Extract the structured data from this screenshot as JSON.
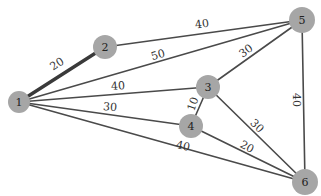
{
  "graph": {
    "node_color": "#a6a6a6",
    "edge_color": "#4a4a4a",
    "nodes": [
      {
        "id": "1",
        "label": "1",
        "x": 19,
        "y": 102,
        "r": 11
      },
      {
        "id": "2",
        "label": "2",
        "x": 105,
        "y": 47,
        "r": 12
      },
      {
        "id": "3",
        "label": "3",
        "x": 208,
        "y": 87,
        "r": 12
      },
      {
        "id": "4",
        "label": "4",
        "x": 191,
        "y": 126,
        "r": 12
      },
      {
        "id": "5",
        "label": "5",
        "x": 302,
        "y": 20,
        "r": 13
      },
      {
        "id": "6",
        "label": "6",
        "x": 305,
        "y": 182,
        "r": 13
      }
    ],
    "edges": [
      {
        "from": "1",
        "to": "2",
        "weight": "20",
        "thick": true,
        "lx": 57,
        "ly": 64,
        "rot": -33
      },
      {
        "from": "2",
        "to": "5",
        "weight": "40",
        "thick": false,
        "lx": 202,
        "ly": 24,
        "rot": -8
      },
      {
        "from": "1",
        "to": "5",
        "weight": "50",
        "thick": false,
        "lx": 158,
        "ly": 55,
        "rot": -16
      },
      {
        "from": "1",
        "to": "3",
        "weight": "40",
        "thick": false,
        "lx": 118,
        "ly": 86,
        "rot": -4
      },
      {
        "from": "1",
        "to": "4",
        "weight": "30",
        "thick": false,
        "lx": 110,
        "ly": 107,
        "rot": 5
      },
      {
        "from": "1",
        "to": "6",
        "weight": "40",
        "thick": false,
        "lx": 183,
        "ly": 146,
        "rot": 12
      },
      {
        "from": "3",
        "to": "5",
        "weight": "30",
        "thick": false,
        "lx": 246,
        "ly": 51,
        "rot": -36
      },
      {
        "from": "3",
        "to": "4",
        "weight": "10",
        "thick": false,
        "lx": 193,
        "ly": 104,
        "rot": -70
      },
      {
        "from": "3",
        "to": "6",
        "weight": "30",
        "thick": false,
        "lx": 257,
        "ly": 126,
        "rot": 45
      },
      {
        "from": "4",
        "to": "6",
        "weight": "20",
        "thick": false,
        "lx": 247,
        "ly": 147,
        "rot": 28
      },
      {
        "from": "5",
        "to": "6",
        "weight": "40",
        "thick": false,
        "lx": 296,
        "ly": 100,
        "rot": 90
      }
    ]
  }
}
